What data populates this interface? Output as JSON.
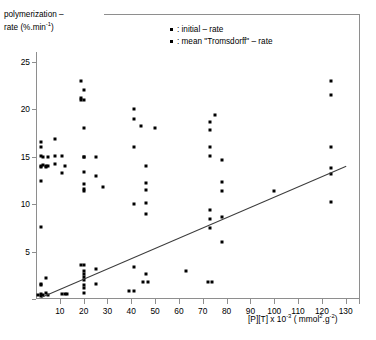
{
  "chart_data": {
    "type": "scatter",
    "title": "",
    "ylabel_line1": "polymerization –",
    "ylabel_line2": "rate (%.min",
    "ylabel_exp": "-1",
    "ylabel_close": ")",
    "xlabel_main": "[P][T] x 10",
    "xlabel_exp": "-3",
    "xlabel_units_open": "( mmol",
    "xlabel_units_sup1": "2",
    "xlabel_units_mid": ".g",
    "xlabel_units_sup2": "-2",
    "xlabel_units_close": ")",
    "xlim": [
      0,
      136
    ],
    "ylim": [
      0,
      26
    ],
    "xticks": [
      10,
      20,
      30,
      40,
      50,
      60,
      70,
      80,
      90,
      100,
      110,
      120,
      130
    ],
    "yticks": [
      0,
      5,
      10,
      15,
      20,
      25
    ],
    "ytick_labels": [
      "",
      "5",
      "10",
      "15",
      "20",
      "25"
    ],
    "grid": false,
    "legend_position": "top-center",
    "legend": [
      {
        "marker": "square",
        "label": ": initial – rate"
      },
      {
        "marker": "square",
        "label": ": mean \"Tromsdorff\" – rate"
      }
    ],
    "trendline": {
      "x0": 2,
      "y0": 0.2,
      "x1": 130,
      "y1": 14.0
    },
    "series": [
      {
        "name": "initial - rate",
        "marker": "square",
        "points": [
          [
            2,
            14.0
          ],
          [
            2,
            15.1
          ],
          [
            2,
            16.0
          ],
          [
            2,
            16.5
          ],
          [
            2,
            13.9
          ],
          [
            2,
            12.4
          ],
          [
            2,
            7.6
          ],
          [
            3,
            15.0
          ],
          [
            3,
            14.1
          ],
          [
            4,
            14.0
          ],
          [
            4,
            13.9
          ],
          [
            5,
            15.0
          ],
          [
            5,
            14.0
          ],
          [
            8,
            16.8
          ],
          [
            8,
            15.1
          ],
          [
            8,
            14.2
          ],
          [
            11,
            15.1
          ],
          [
            11,
            13.3
          ],
          [
            12,
            14.0
          ],
          [
            19,
            23.0
          ],
          [
            19,
            21.0
          ],
          [
            19,
            21.2
          ],
          [
            20,
            22.0
          ],
          [
            20,
            21.0
          ],
          [
            20,
            18.0
          ],
          [
            20,
            15.0
          ],
          [
            20,
            14.9
          ],
          [
            20,
            13.4
          ],
          [
            20,
            12.1
          ],
          [
            20,
            11.6
          ],
          [
            20,
            11.4
          ],
          [
            25,
            15.0
          ],
          [
            25,
            13.0
          ],
          [
            28,
            11.8
          ],
          [
            41,
            20.0
          ],
          [
            41,
            19.0
          ],
          [
            44,
            18.2
          ],
          [
            41,
            16.0
          ],
          [
            46,
            14.0
          ],
          [
            46,
            12.2
          ],
          [
            46,
            11.5
          ],
          [
            41,
            10.0
          ],
          [
            46,
            10.1
          ],
          [
            46,
            9.0
          ],
          [
            50,
            18.0
          ],
          [
            75,
            19.4
          ],
          [
            73,
            18.6
          ],
          [
            73,
            17.8
          ],
          [
            73,
            16.0
          ],
          [
            73,
            15.1
          ],
          [
            78,
            14.6
          ],
          [
            78,
            12.3
          ],
          [
            78,
            11.4
          ],
          [
            73,
            9.4
          ],
          [
            73,
            8.4
          ],
          [
            73,
            7.5
          ],
          [
            78,
            6.0
          ],
          [
            100,
            11.4
          ],
          [
            124,
            23.0
          ],
          [
            124,
            21.5
          ],
          [
            124,
            16.0
          ],
          [
            124,
            13.8
          ],
          [
            124,
            13.2
          ],
          [
            124,
            10.2
          ]
        ]
      },
      {
        "name": "mean Tromsdorff - rate",
        "marker": "square",
        "points": [
          [
            1,
            0.4
          ],
          [
            2,
            0.5
          ],
          [
            2,
            0.3
          ],
          [
            3,
            0.4
          ],
          [
            4,
            0.6
          ],
          [
            5,
            0.4
          ],
          [
            2,
            1.6
          ],
          [
            2,
            1.5
          ],
          [
            4,
            2.2
          ],
          [
            11,
            0.5
          ],
          [
            12,
            0.5
          ],
          [
            13,
            0.5
          ],
          [
            19,
            3.6
          ],
          [
            20,
            3.6
          ],
          [
            20,
            2.9
          ],
          [
            20,
            2.6
          ],
          [
            20,
            2.3
          ],
          [
            20,
            2.0
          ],
          [
            20,
            1.5
          ],
          [
            20,
            1.2
          ],
          [
            20,
            0.6
          ],
          [
            25,
            3.2
          ],
          [
            25,
            1.6
          ],
          [
            41,
            3.4
          ],
          [
            46,
            2.6
          ],
          [
            45,
            1.8
          ],
          [
            47,
            1.8
          ],
          [
            39,
            0.8
          ],
          [
            41,
            0.8
          ],
          [
            63,
            3.0
          ],
          [
            72,
            1.8
          ],
          [
            74,
            1.8
          ],
          [
            78,
            8.6
          ]
        ]
      }
    ]
  }
}
